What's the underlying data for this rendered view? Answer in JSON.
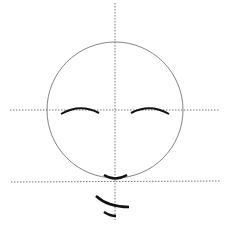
{
  "diagram": {
    "colors": {
      "guide": "#555555",
      "circle": "#666666",
      "stroke": "#111111",
      "background": "#ffffff"
    },
    "circle": {
      "cx": 115,
      "cy": 110,
      "r": 68
    },
    "guides": {
      "vertical": {
        "x": 115,
        "y1": 3,
        "y2": 220
      },
      "horizontal_eye": {
        "y": 110,
        "x1": 10,
        "x2": 220
      },
      "horizontal_chin": {
        "y": 182,
        "x1": 11,
        "x2": 220
      }
    },
    "strokes": [
      "left-eye",
      "right-eye",
      "mouth",
      "chin-curve",
      "lower-tick"
    ]
  }
}
